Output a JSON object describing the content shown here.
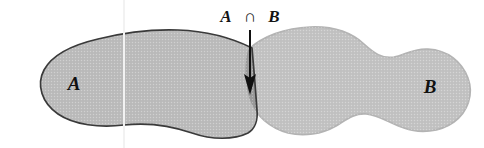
{
  "figure": {
    "background_color": "#ffffff"
  },
  "sets": {
    "a": {
      "label": "A",
      "fill_color": "#bcbcbc",
      "stroke_color": "#3a3a3a",
      "label_x": 74,
      "label_y": 90
    },
    "b": {
      "label": "B",
      "fill_color": "#c3c3c3",
      "stroke_color": "#b0b0b0",
      "label_x": 430,
      "label_y": 93
    }
  },
  "intersection": {
    "label_set_a": "A",
    "operator": "∩",
    "label_set_b": "B",
    "full_label": "A ∩ B",
    "fill_color": "#9b9b9b",
    "label_x": 250,
    "label_y": 22,
    "arrow_color": "#101010",
    "arrow_start_y": 30,
    "arrow_end_y": 93,
    "arrow_x": 250
  }
}
